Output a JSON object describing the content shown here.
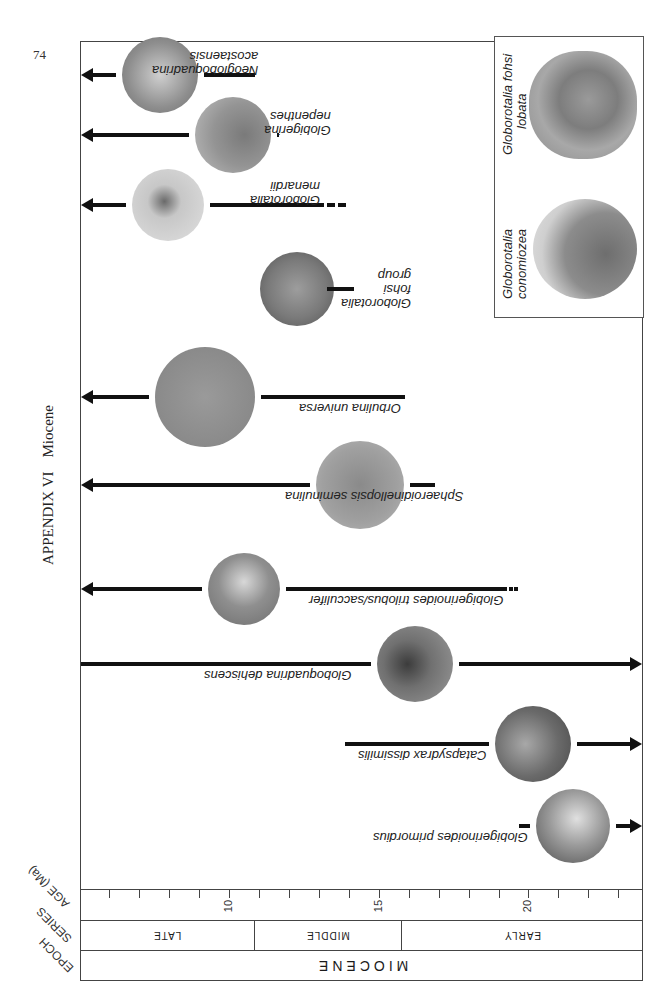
{
  "page": {
    "number": "74",
    "running_head": {
      "appendix": "APPENDIX VI",
      "section": "Miocene"
    }
  },
  "axis": {
    "titles": {
      "age": "AGE (Ma)",
      "series": "SERIES",
      "epoch": "EPOCH"
    },
    "ticks": [
      {
        "value": 6,
        "x": 108,
        "label": ""
      },
      {
        "value": 7,
        "x": 138,
        "label": ""
      },
      {
        "value": 8,
        "x": 168,
        "label": ""
      },
      {
        "value": 9,
        "x": 198,
        "label": ""
      },
      {
        "value": 10,
        "x": 228,
        "label": "10"
      },
      {
        "value": 11,
        "x": 258,
        "label": ""
      },
      {
        "value": 12,
        "x": 288,
        "label": ""
      },
      {
        "value": 13,
        "x": 318,
        "label": ""
      },
      {
        "value": 14,
        "x": 348,
        "label": ""
      },
      {
        "value": 15,
        "x": 378,
        "label": "15"
      },
      {
        "value": 16,
        "x": 408,
        "label": ""
      },
      {
        "value": 17,
        "x": 438,
        "label": ""
      },
      {
        "value": 18,
        "x": 468,
        "label": ""
      },
      {
        "value": 19,
        "x": 498,
        "label": ""
      },
      {
        "value": 20,
        "x": 527,
        "label": "20"
      },
      {
        "value": 21,
        "x": 557,
        "label": ""
      },
      {
        "value": 22,
        "x": 587,
        "label": ""
      },
      {
        "value": 23,
        "x": 617,
        "label": ""
      }
    ],
    "series": [
      {
        "label": "LATE",
        "from_x": 0,
        "to_x": 173
      },
      {
        "label": "MIDDLE",
        "from_x": 173,
        "to_x": 320
      },
      {
        "label": "EARLY",
        "from_x": 320,
        "to_x": 563
      }
    ],
    "epoch": "MIOCENE"
  },
  "taxa": [
    {
      "name": "Neogloboquadrina acostaensis",
      "lines": [
        "Neogloboquadrina",
        "acostaensis"
      ],
      "first_appearance_ma": 10.9,
      "extends_younger": true,
      "extends_older": false,
      "y": 75
    },
    {
      "name": "Globigerina nepenthes",
      "lines": [
        "Globigerina",
        "nepenthes"
      ],
      "first_appearance_ma": 11.7,
      "extends_younger": true,
      "extends_older": false,
      "y": 135
    },
    {
      "name": "Globorotalia menardii",
      "lines": [
        "Globorotalia",
        "menardii"
      ],
      "first_appearance_ma": 13.2,
      "uncertain_extension_ma": 14.0,
      "extends_younger": true,
      "extends_older": false,
      "y": 205
    },
    {
      "name": "Globorotalia fohsi group",
      "lines": [
        "Globorotalia",
        "fohsi",
        "group"
      ],
      "range_ma": [
        13.3,
        14.2
      ],
      "extends_younger": false,
      "extends_older": false,
      "y": 289
    },
    {
      "name": "Orbulina universa",
      "lines": [
        "Orbulina universa"
      ],
      "first_appearance_ma": 15.9,
      "extends_younger": true,
      "extends_older": false,
      "y": 397
    },
    {
      "name": "Sphaeroidinellopsis seminulina",
      "lines": [
        "Sphaeroidinellopsis seminulina"
      ],
      "first_appearance_ma": 16.9,
      "extends_younger": true,
      "extends_older": false,
      "y": 485
    },
    {
      "name": "Globigerinoides trilobus/sacculifer",
      "lines": [
        "Globigerinoides trilobus/sacculifer"
      ],
      "first_appearance_ma": 19.3,
      "uncertain_extension_ma": 19.7,
      "extends_younger": true,
      "extends_older": false,
      "y": 589
    },
    {
      "name": "Globoquadrina dehiscens",
      "lines": [
        "Globoquadrina dehiscens"
      ],
      "range_ma": [
        5.1,
        23.8
      ],
      "extends_younger": false,
      "extends_older": true,
      "y": 664
    },
    {
      "name": "Catapsydrax dissimilis",
      "lines": [
        "Catapsydrax dissimilis"
      ],
      "last_appearance_ma": 13.9,
      "extends_younger": false,
      "extends_older": true,
      "y": 744
    },
    {
      "name": "Globigerinoides primordius",
      "lines": [
        "Globigerinoides primordius"
      ],
      "last_appearance_ma": 19.7,
      "extends_younger": false,
      "extends_older": true,
      "y": 826
    }
  ],
  "inset": {
    "specimens": [
      {
        "name": "Globorotalia conomiozea",
        "lines": [
          "Globorotalia",
          "conomiozea"
        ]
      },
      {
        "name": "Globorotalia fohsi lobata",
        "lines": [
          "Globorotalia  fohsi",
          "lobata"
        ]
      }
    ]
  }
}
